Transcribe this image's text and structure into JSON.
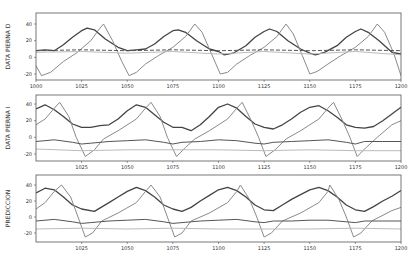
{
  "chart_data": [
    {
      "type": "line",
      "title": "",
      "xlabel": "",
      "ylabel": "DATA PIERNA D",
      "xlim": [
        1000,
        1200
      ],
      "ylim": [
        -28,
        52
      ],
      "xticks": [
        1000,
        1025,
        1050,
        1075,
        1100,
        1125,
        1150,
        1175,
        1200
      ],
      "yticks": [
        -20,
        0,
        20,
        40
      ],
      "grid": false,
      "legend": null,
      "series": [
        {
          "name": "series-dark-thick",
          "color": "#444444",
          "width": 1.3,
          "x": [
            1000,
            1005,
            1010,
            1015,
            1020,
            1025,
            1028,
            1032,
            1038,
            1045,
            1050,
            1055,
            1060,
            1065,
            1070,
            1075,
            1078,
            1082,
            1088,
            1095,
            1100,
            1103,
            1108,
            1115,
            1120,
            1125,
            1128,
            1132,
            1138,
            1145,
            1150,
            1153,
            1158,
            1165,
            1170,
            1175,
            1178,
            1182,
            1188,
            1195,
            1200
          ],
          "y": [
            8,
            9,
            8,
            15,
            24,
            32,
            35,
            33,
            22,
            12,
            8,
            9,
            10,
            16,
            25,
            32,
            33,
            30,
            20,
            10,
            7,
            3,
            5,
            14,
            24,
            31,
            34,
            31,
            20,
            10,
            5,
            3,
            6,
            14,
            24,
            31,
            34,
            30,
            20,
            6,
            4
          ]
        },
        {
          "name": "series-medium-sawtooth",
          "color": "#8a8a8a",
          "width": 1.0,
          "x": [
            1000,
            1003,
            1008,
            1015,
            1022,
            1030,
            1035,
            1037,
            1042,
            1047,
            1051,
            1055,
            1060,
            1067,
            1075,
            1082,
            1087,
            1091,
            1096,
            1101,
            1105,
            1110,
            1117,
            1125,
            1132,
            1137,
            1141,
            1146,
            1150,
            1154,
            1160,
            1167,
            1175,
            1182,
            1187,
            1191,
            1196,
            1200
          ],
          "y": [
            -10,
            -22,
            -18,
            -5,
            5,
            20,
            35,
            40,
            20,
            -5,
            -22,
            -18,
            -8,
            2,
            12,
            25,
            40,
            30,
            5,
            -20,
            -18,
            -8,
            2,
            12,
            25,
            40,
            28,
            2,
            -20,
            -17,
            -8,
            2,
            12,
            25,
            40,
            30,
            5,
            -22
          ]
        },
        {
          "name": "series-dark-flat",
          "color": "#555555",
          "width": 1.0,
          "dash": "4,2",
          "x": [
            1000,
            1025,
            1050,
            1075,
            1100,
            1125,
            1150,
            1175,
            1200
          ],
          "y": [
            8,
            9,
            8,
            9,
            8,
            9,
            8,
            9,
            8
          ]
        },
        {
          "name": "series-light-flat",
          "color": "#bbbbbb",
          "width": 1.0,
          "x": [
            1000,
            1025,
            1050,
            1075,
            1100,
            1125,
            1150,
            1175,
            1200
          ],
          "y": [
            6,
            7,
            5,
            7,
            4,
            7,
            4,
            7,
            3
          ]
        }
      ]
    },
    {
      "type": "line",
      "title": "",
      "xlabel": "",
      "ylabel": "DATA PIERNA I",
      "xlim": [
        1000,
        1200
      ],
      "ylim": [
        -28,
        52
      ],
      "xticks": [
        1025,
        1050,
        1075,
        1100,
        1125,
        1150,
        1175,
        1200
      ],
      "yticks": [
        -20,
        0,
        20,
        40
      ],
      "grid": false,
      "legend": null,
      "series": [
        {
          "name": "series-dark-thick",
          "color": "#444444",
          "width": 1.3,
          "x": [
            1000,
            1005,
            1010,
            1015,
            1020,
            1025,
            1030,
            1035,
            1040,
            1045,
            1050,
            1055,
            1060,
            1065,
            1070,
            1075,
            1080,
            1085,
            1090,
            1095,
            1100,
            1105,
            1110,
            1115,
            1120,
            1125,
            1130,
            1135,
            1140,
            1145,
            1150,
            1155,
            1160,
            1165,
            1170,
            1175,
            1180,
            1185,
            1190,
            1195,
            1200
          ],
          "y": [
            34,
            39,
            33,
            25,
            16,
            12,
            12,
            14,
            15,
            22,
            32,
            39,
            36,
            27,
            18,
            12,
            12,
            8,
            15,
            25,
            36,
            40,
            35,
            25,
            16,
            12,
            10,
            15,
            22,
            30,
            36,
            38,
            32,
            24,
            15,
            12,
            11,
            13,
            20,
            28,
            36
          ]
        },
        {
          "name": "series-medium-sawtooth",
          "color": "#8a8a8a",
          "width": 1.0,
          "x": [
            1000,
            1005,
            1010,
            1013,
            1018,
            1022,
            1027,
            1032,
            1037,
            1045,
            1055,
            1060,
            1063,
            1068,
            1072,
            1077,
            1082,
            1087,
            1095,
            1105,
            1110,
            1113,
            1118,
            1122,
            1126,
            1131,
            1137,
            1145,
            1155,
            1160,
            1163,
            1168,
            1172,
            1176,
            1181,
            1187,
            1195,
            1200
          ],
          "y": [
            15,
            22,
            35,
            42,
            25,
            0,
            -23,
            -15,
            -2,
            8,
            22,
            35,
            42,
            25,
            0,
            -23,
            -12,
            -2,
            8,
            22,
            35,
            42,
            20,
            0,
            -23,
            -15,
            -2,
            8,
            22,
            35,
            42,
            20,
            0,
            -23,
            -12,
            0,
            15,
            20
          ]
        },
        {
          "name": "series-dark-flat",
          "color": "#555555",
          "width": 1.0,
          "x": [
            1000,
            1010,
            1020,
            1025,
            1030,
            1040,
            1050,
            1060,
            1070,
            1075,
            1080,
            1090,
            1100,
            1110,
            1120,
            1125,
            1130,
            1140,
            1150,
            1160,
            1170,
            1175,
            1180,
            1190,
            1200
          ],
          "y": [
            -5,
            -3,
            -6,
            -8,
            -7,
            -5,
            -4,
            -3,
            -6,
            -8,
            -6,
            -5,
            -3,
            -4,
            -7,
            -8,
            -6,
            -5,
            -4,
            -3,
            -6,
            -8,
            -5,
            -5,
            -5
          ]
        },
        {
          "name": "series-light-flat",
          "color": "#bbbbbb",
          "width": 1.0,
          "x": [
            1000,
            1025,
            1050,
            1075,
            1100,
            1125,
            1150,
            1175,
            1200
          ],
          "y": [
            -14,
            -16,
            -15,
            -15,
            -15,
            -16,
            -15,
            -16,
            -16
          ]
        }
      ]
    },
    {
      "type": "line",
      "title": "",
      "xlabel": "",
      "ylabel": "PREDICCION",
      "xlim": [
        1000,
        1200
      ],
      "ylim": [
        -32,
        52
      ],
      "xticks": [
        1025,
        1050,
        1075,
        1100,
        1125,
        1150,
        1175,
        1200
      ],
      "yticks": [
        -20,
        0,
        20,
        40
      ],
      "grid": false,
      "legend": null,
      "series": [
        {
          "name": "series-dark-thick",
          "color": "#444444",
          "width": 1.3,
          "x": [
            1000,
            1005,
            1010,
            1015,
            1020,
            1025,
            1032,
            1040,
            1045,
            1050,
            1055,
            1060,
            1065,
            1070,
            1075,
            1080,
            1085,
            1090,
            1095,
            1100,
            1105,
            1110,
            1115,
            1120,
            1125,
            1130,
            1135,
            1140,
            1145,
            1150,
            1155,
            1160,
            1165,
            1170,
            1175,
            1180,
            1185,
            1190,
            1195,
            1200
          ],
          "y": [
            30,
            36,
            34,
            25,
            15,
            10,
            7,
            18,
            25,
            32,
            37,
            33,
            25,
            15,
            10,
            7,
            12,
            20,
            27,
            34,
            37,
            33,
            25,
            15,
            9,
            8,
            15,
            22,
            28,
            34,
            37,
            33,
            25,
            15,
            9,
            7,
            13,
            20,
            26,
            33
          ]
        },
        {
          "name": "series-medium-sawtooth",
          "color": "#8a8a8a",
          "width": 1.0,
          "x": [
            1000,
            1005,
            1010,
            1014,
            1019,
            1023,
            1027,
            1031,
            1036,
            1045,
            1055,
            1060,
            1063,
            1068,
            1072,
            1076,
            1080,
            1085,
            1095,
            1105,
            1110,
            1112,
            1117,
            1121,
            1125,
            1129,
            1135,
            1145,
            1155,
            1160,
            1161,
            1166,
            1170,
            1174,
            1178,
            1184,
            1195,
            1200
          ],
          "y": [
            10,
            18,
            32,
            40,
            25,
            0,
            -25,
            -20,
            -5,
            5,
            18,
            32,
            40,
            25,
            0,
            -25,
            -20,
            -5,
            5,
            18,
            32,
            40,
            22,
            0,
            -25,
            -20,
            -5,
            5,
            18,
            32,
            40,
            22,
            0,
            -25,
            -20,
            -5,
            8,
            12
          ]
        },
        {
          "name": "series-dark-flat",
          "color": "#555555",
          "width": 1.0,
          "x": [
            1000,
            1010,
            1020,
            1025,
            1030,
            1040,
            1050,
            1060,
            1070,
            1075,
            1080,
            1090,
            1100,
            1110,
            1120,
            1125,
            1130,
            1140,
            1150,
            1160,
            1170,
            1175,
            1180,
            1190,
            1200
          ],
          "y": [
            -5,
            -3,
            -6,
            -8,
            -7,
            -5,
            -4,
            -3,
            -6,
            -8,
            -7,
            -5,
            -4,
            -3,
            -6,
            -7,
            -5,
            -5,
            -4,
            -4,
            -6,
            -7,
            -5,
            -5,
            -5
          ]
        },
        {
          "name": "series-light-flat",
          "color": "#bbbbbb",
          "width": 1.0,
          "x": [
            1000,
            1025,
            1050,
            1075,
            1100,
            1125,
            1150,
            1175,
            1200
          ],
          "y": [
            -15,
            -14,
            -15,
            -14,
            -15,
            -15,
            -15,
            -14,
            -15
          ]
        }
      ]
    }
  ],
  "panels": [
    {
      "ylabel": "DATA PIERNA D",
      "x_tick_labels": [
        "1000",
        "1025",
        "1050",
        "1075",
        "1100",
        "1125",
        "1150",
        "1175",
        "1200"
      ],
      "y_tick_labels": [
        "-20",
        "0",
        "20",
        "40"
      ]
    },
    {
      "ylabel": "DATA PIERNA I",
      "x_tick_labels": [
        "1025",
        "1050",
        "1075",
        "1100",
        "1125",
        "1150",
        "1175",
        "1200"
      ],
      "y_tick_labels": [
        "-20",
        "0",
        "20",
        "40"
      ]
    },
    {
      "ylabel": "PREDICCION",
      "x_tick_labels": [
        "1025",
        "1050",
        "1075",
        "1100",
        "1125",
        "1150",
        "1175",
        "1200"
      ],
      "y_tick_labels": [
        "-20",
        "0",
        "20",
        "40"
      ]
    }
  ]
}
